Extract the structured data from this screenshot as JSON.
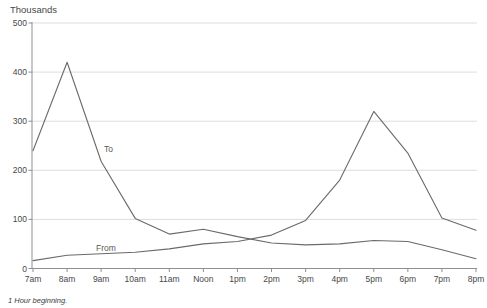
{
  "chart_data": {
    "type": "line",
    "ylabel": "Thousands",
    "footnote": "1  Hour beginning.",
    "categories": [
      "7am",
      "8am",
      "9am",
      "10am",
      "11am",
      "Noon",
      "1pm",
      "2pm",
      "3pm",
      "4pm",
      "5pm",
      "6pm",
      "7pm",
      "8pm"
    ],
    "series": [
      {
        "name": "To",
        "values": [
          240,
          420,
          218,
          102,
          70,
          80,
          65,
          52,
          48,
          50,
          57,
          55,
          38,
          20
        ]
      },
      {
        "name": "From",
        "values": [
          16,
          27,
          30,
          33,
          40,
          50,
          55,
          68,
          98,
          180,
          320,
          235,
          103,
          78
        ]
      }
    ],
    "ylim": [
      0,
      500
    ],
    "yticks": [
      0,
      100,
      200,
      300,
      400,
      500
    ],
    "grid": true,
    "legend_position": "inline-labels",
    "colors": {
      "line": "#6a6a6a",
      "grid": "#dddddd",
      "axis": "#8f8f8f",
      "text": "#474747"
    }
  }
}
